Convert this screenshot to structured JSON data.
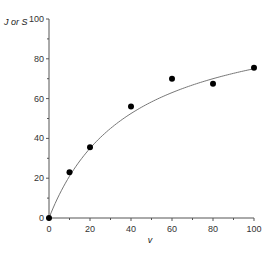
{
  "chart_data": {
    "type": "scatter",
    "title": "",
    "xlabel": "v",
    "ylabel": "J or S",
    "xlim": [
      0,
      100
    ],
    "ylim": [
      0,
      100
    ],
    "x_ticks": [
      0,
      20,
      40,
      60,
      80,
      100
    ],
    "y_ticks": [
      0,
      20,
      40,
      60,
      80,
      100
    ],
    "x_minor_ticks": [
      10,
      30,
      50,
      70,
      90
    ],
    "y_minor_ticks": [
      10,
      30,
      50,
      70,
      90
    ],
    "grid": false,
    "legend": null,
    "series": [
      {
        "name": "observed",
        "style": "filled-circle-markers",
        "x": [
          0,
          10,
          20,
          40,
          60,
          80,
          100
        ],
        "y": [
          0,
          23,
          35.5,
          56,
          70,
          67.5,
          75.5
        ]
      },
      {
        "name": "fitted curve",
        "style": "thin-line",
        "model": "hyperbolic (Michaelis-Menten): y = Vmax*v/(K+v)",
        "params": {
          "Vmax": 105,
          "K": 40
        }
      }
    ]
  },
  "colors": {
    "axis": "#555555",
    "curve": "#777777",
    "marker": "#000000"
  }
}
